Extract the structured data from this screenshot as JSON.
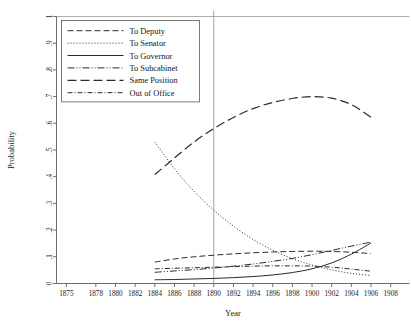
{
  "chart_data": {
    "type": "line",
    "title": "",
    "xlabel": "Year",
    "ylabel": "Probability",
    "xlim": [
      1874,
      1909
    ],
    "ylim": [
      0,
      1
    ],
    "grid": false,
    "legend_position": "top-left",
    "reference_line": {
      "x": 1890,
      "label": "1890"
    },
    "x_ticks": [
      1875,
      1878,
      1880,
      1882,
      1884,
      1886,
      1888,
      1890,
      1892,
      1894,
      1896,
      1898,
      1900,
      1902,
      1904,
      1906,
      1908
    ],
    "y_ticks": [
      0,
      0.1,
      0.2,
      0.3,
      0.4,
      0.5,
      0.6,
      0.7,
      0.8,
      0.9,
      1
    ],
    "y_tick_labels": [
      "0",
      ".1",
      ".2",
      ".3",
      ".4",
      ".5",
      ".6",
      ".7",
      ".8",
      ".9",
      "1"
    ],
    "x": [
      1884,
      1886,
      1888,
      1890,
      1892,
      1894,
      1896,
      1898,
      1900,
      1902,
      1904,
      1906
    ],
    "series": [
      {
        "name": "To Deputy",
        "dash": "6,3",
        "width": 1.0,
        "values": [
          0.08,
          0.092,
          0.1,
          0.106,
          0.111,
          0.115,
          0.118,
          0.12,
          0.121,
          0.12,
          0.117,
          0.112
        ]
      },
      {
        "name": "To Senator",
        "dash": "1,2",
        "width": 1.0,
        "values": [
          0.53,
          0.43,
          0.345,
          0.275,
          0.215,
          0.165,
          0.125,
          0.093,
          0.069,
          0.051,
          0.038,
          0.03
        ]
      },
      {
        "name": "To Governor",
        "dash": "none",
        "width": 1.0,
        "values": [
          0.014,
          0.015,
          0.017,
          0.019,
          0.022,
          0.026,
          0.032,
          0.041,
          0.055,
          0.077,
          0.11,
          0.152
        ]
      },
      {
        "name": "To Subcabinet",
        "dash": "7,2,1,2,1,2",
        "width": 1.0,
        "values": [
          0.042,
          0.047,
          0.052,
          0.058,
          0.065,
          0.073,
          0.083,
          0.094,
          0.108,
          0.124,
          0.14,
          0.155
        ]
      },
      {
        "name": "Same Position",
        "dash": "9,4",
        "width": 1.2,
        "values": [
          0.408,
          0.47,
          0.53,
          0.58,
          0.622,
          0.655,
          0.678,
          0.693,
          0.7,
          0.694,
          0.67,
          0.622
        ]
      },
      {
        "name": "Out of Office",
        "dash": "5,2,1,2",
        "width": 1.0,
        "values": [
          0.055,
          0.057,
          0.059,
          0.061,
          0.063,
          0.065,
          0.066,
          0.066,
          0.065,
          0.061,
          0.054,
          0.046
        ]
      }
    ]
  },
  "legend": {
    "items": [
      {
        "label": "To Deputy"
      },
      {
        "label": "To Senator"
      },
      {
        "label": "To Governor"
      },
      {
        "label": "To Subcabinet"
      },
      {
        "label": "Same Position"
      },
      {
        "label": "Out of Office"
      }
    ]
  },
  "axes": {
    "x_title": "Year",
    "y_title": "Probability"
  }
}
